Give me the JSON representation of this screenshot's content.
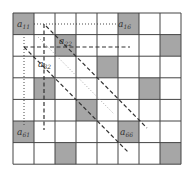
{
  "diagram": {
    "type": "matrix-grid",
    "rows": 7,
    "cols": 8,
    "origin": {
      "x": 13,
      "y": 13
    },
    "cell_width": 21,
    "cell_height": 21.6,
    "colors": {
      "shaded": "#a6a6a6",
      "empty": "#ffffff",
      "grid_line": "#444444",
      "line": "#333333",
      "dotted_light": "#999999"
    },
    "shaded_cells": [
      {
        "row": 0,
        "col": 0
      },
      {
        "row": 0,
        "col": 5
      },
      {
        "row": 1,
        "col": 2
      },
      {
        "row": 1,
        "col": 7
      },
      {
        "row": 2,
        "col": 4
      },
      {
        "row": 3,
        "col": 1
      },
      {
        "row": 3,
        "col": 6
      },
      {
        "row": 4,
        "col": 3
      },
      {
        "row": 5,
        "col": 0
      },
      {
        "row": 5,
        "col": 5
      },
      {
        "row": 6,
        "col": 2
      },
      {
        "row": 6,
        "col": 7
      }
    ],
    "labels": [
      {
        "id": "a11",
        "base": "a",
        "sub": "11",
        "x": 17,
        "y": 27
      },
      {
        "id": "a16",
        "base": "a",
        "sub": "16",
        "x": 118,
        "y": 27
      },
      {
        "id": "a22",
        "base": "a",
        "sub": "22",
        "x": 59,
        "y": 44
      },
      {
        "id": "a32",
        "base": "a",
        "sub": "32",
        "x": 38,
        "y": 67
      },
      {
        "id": "a61",
        "base": "a",
        "sub": "61",
        "x": 17,
        "y": 135
      },
      {
        "id": "a66",
        "base": "a",
        "sub": "66",
        "x": 120,
        "y": 135
      }
    ],
    "lines": [
      {
        "id": "row-dotted",
        "style": "dotted",
        "x1": 34,
        "y1": 24,
        "x2": 117,
        "y2": 24
      },
      {
        "id": "col-dotted",
        "style": "dotted",
        "x1": 24,
        "y1": 37,
        "x2": 24,
        "y2": 126
      },
      {
        "id": "row-dashed",
        "style": "dashed",
        "x1": 24,
        "y1": 47,
        "x2": 130,
        "y2": 47
      },
      {
        "id": "col-dashed",
        "style": "dashed",
        "x1": 44,
        "y1": 24,
        "x2": 44,
        "y2": 130
      },
      {
        "id": "diag-dashed-upper",
        "style": "dashed",
        "x1": 46,
        "y1": 26,
        "x2": 147,
        "y2": 128
      },
      {
        "id": "diag-dotted",
        "style": "dotted-light",
        "x1": 38,
        "y1": 37,
        "x2": 114,
        "y2": 114
      },
      {
        "id": "diag-dashed-lower",
        "style": "dashed",
        "x1": 24,
        "y1": 47,
        "x2": 128,
        "y2": 152
      }
    ]
  }
}
